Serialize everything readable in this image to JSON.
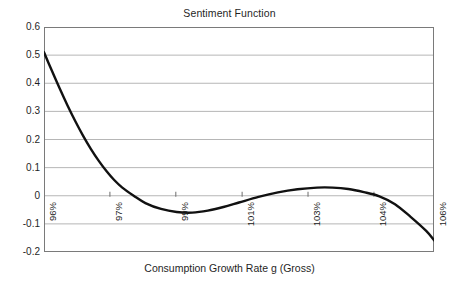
{
  "chart_data": {
    "type": "line",
    "title": "Sentiment Function",
    "xlabel": "Consumption Growth Rate g (Gross)",
    "ylabel": "",
    "grid": true,
    "legend": "none",
    "ylim": [
      -0.2,
      0.6
    ],
    "ytick_labels": [
      "0.6",
      "0.5",
      "0.4",
      "0.3",
      "0.2",
      "0.1",
      "0",
      "-0.1",
      "-0.2"
    ],
    "ytick_values": [
      0.6,
      0.5,
      0.4,
      0.3,
      0.2,
      0.1,
      0,
      -0.1,
      -0.2
    ],
    "xtick_labels": [
      "96%",
      "97%",
      "99%",
      "101%",
      "103%",
      "104%",
      "106%"
    ],
    "xtick_positions_pct": [
      0,
      16.9,
      33.8,
      50.8,
      67.7,
      84.6,
      100
    ],
    "line_color": "#111111",
    "grid_color": "#b6b6b6",
    "axis_color": "#6d6d6d",
    "series": [
      {
        "name": "Sentiment",
        "x": [
          96.0,
          96.2,
          96.4,
          96.6,
          96.8,
          97.0,
          97.2,
          97.4,
          97.6,
          97.8,
          98.0,
          98.3,
          98.6,
          99.0,
          99.4,
          99.8,
          100.2,
          100.6,
          101.0,
          101.5,
          102.0,
          102.5,
          103.0,
          103.4,
          103.8,
          104.2,
          104.6,
          105.0,
          105.4,
          105.8,
          106.0
        ],
        "y": [
          0.51,
          0.445,
          0.382,
          0.322,
          0.266,
          0.214,
          0.167,
          0.125,
          0.088,
          0.056,
          0.03,
          0.0,
          -0.026,
          -0.047,
          -0.058,
          -0.06,
          -0.053,
          -0.04,
          -0.024,
          -0.004,
          0.012,
          0.023,
          0.029,
          0.029,
          0.024,
          0.013,
          -0.002,
          -0.03,
          -0.075,
          -0.125,
          -0.158
        ]
      }
    ]
  },
  "title": {
    "text": "Sentiment Function"
  },
  "axes": {
    "x_title": "Consumption Growth Rate g (Gross)"
  }
}
